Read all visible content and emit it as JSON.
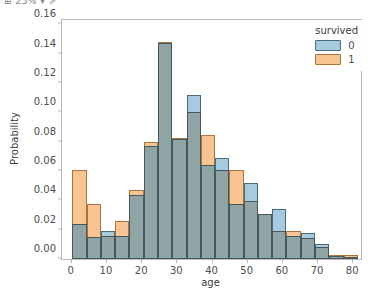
{
  "top_fragment": "⊞ 25% ▾  ⇗",
  "chart_data": {
    "type": "bar",
    "subtype": "overlaid-histogram",
    "title": "",
    "xlabel": "age",
    "ylabel": "Probability",
    "xlim": [
      -2.5,
      82.5
    ],
    "ylim": [
      0.0,
      0.163
    ],
    "xticks": [
      "0",
      "10",
      "20",
      "30",
      "40",
      "50",
      "60",
      "70",
      "80"
    ],
    "xtick_values": [
      0,
      10,
      20,
      30,
      40,
      50,
      60,
      70,
      80
    ],
    "yticks": [
      "0.00",
      "0.02",
      "0.04",
      "0.06",
      "0.08",
      "0.10",
      "0.12",
      "0.14",
      "0.16"
    ],
    "ytick_values": [
      0.0,
      0.02,
      0.04,
      0.06,
      0.08,
      0.1,
      0.12,
      0.14,
      0.16
    ],
    "grid": false,
    "bin_width": 4.06,
    "bin_starts": [
      0.42,
      4.48,
      8.54,
      12.6,
      16.66,
      20.72,
      24.78,
      28.84,
      32.9,
      36.96,
      41.02,
      45.08,
      49.14,
      53.2,
      57.26,
      61.32,
      65.38,
      69.44,
      73.5,
      77.56
    ],
    "legend": {
      "title": "survived",
      "position": "upper right",
      "entries": [
        {
          "label": "0",
          "color": "#a8cade",
          "edge": "#4a6b7c"
        },
        {
          "label": "1",
          "color": "#f7c492",
          "edge": "#a8743a"
        }
      ]
    },
    "series": [
      {
        "name": "0",
        "color": "#a8cade",
        "values": [
          0.024,
          0.0147,
          0.019,
          0.016,
          0.0438,
          0.0772,
          0.1475,
          0.0818,
          0.1122,
          0.0638,
          0.0692,
          0.0372,
          0.0518,
          0.0305,
          0.0338,
          0.016,
          0.0175,
          0.0102,
          0.0018,
          0.0005
        ]
      },
      {
        "name": "1",
        "color": "#f7c492",
        "values": [
          0.0605,
          0.0372,
          0.0158,
          0.0258,
          0.047,
          0.0795,
          0.1482,
          0.0828,
          0.1,
          0.0845,
          0.0605,
          0.0605,
          0.0398,
          0.0305,
          0.0188,
          0.019,
          0.0143,
          0.0085,
          0.0025,
          0.0025
        ]
      }
    ],
    "overlap_color": "#8fa4a4"
  }
}
